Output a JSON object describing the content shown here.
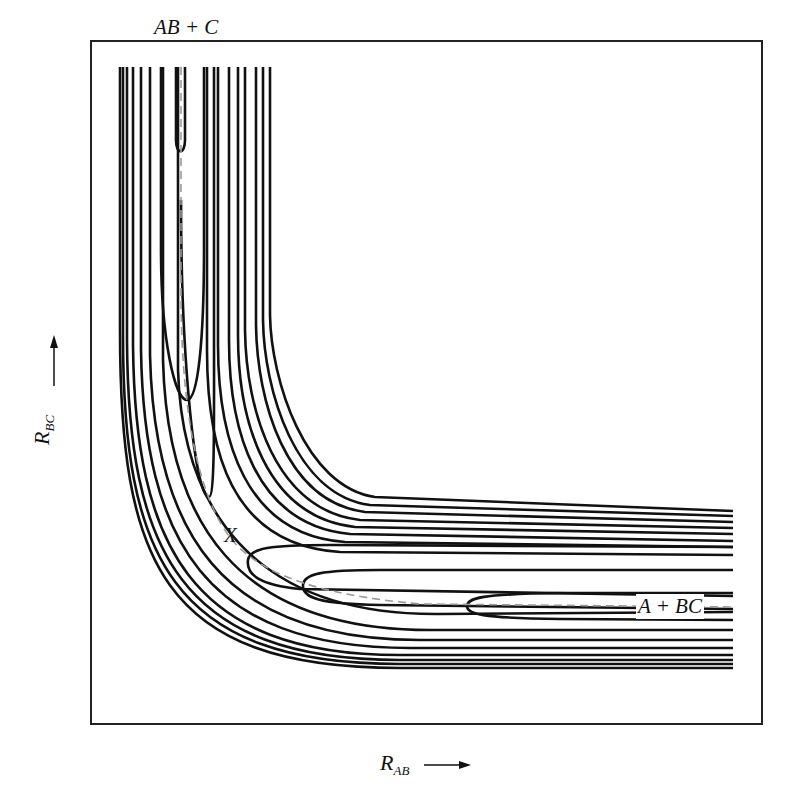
{
  "diagram": {
    "labels": {
      "reactant_valley": "AB + C",
      "product_valley": "A + BC",
      "saddle_point": "X"
    },
    "axes": {
      "x": {
        "symbol": "R",
        "subscript": "AB",
        "arrow": "⟶"
      },
      "y": {
        "symbol": "R",
        "subscript": "BC",
        "arrow": "⟶"
      }
    },
    "colors": {
      "contour": "#111111",
      "reaction_path": "#999999",
      "frame": "#222222",
      "background": "#ffffff"
    },
    "frame": {
      "x": 91,
      "y": 41,
      "width": 671,
      "height": 683
    },
    "contours": {
      "outer_walls": [
        {
          "vx": 120,
          "hy": 668
        },
        {
          "vx": 123,
          "hy": 664
        },
        {
          "vx": 127,
          "hy": 660
        },
        {
          "vx": 133,
          "hy": 655
        },
        {
          "vx": 141,
          "hy": 648
        },
        {
          "vx": 150,
          "hy": 640
        },
        {
          "vx": 163,
          "hy": 630
        },
        {
          "vx": 178,
          "hy": 616
        }
      ],
      "inner_walls": [
        {
          "vx": 207,
          "hy": 555
        },
        {
          "vx": 218,
          "hy": 547
        },
        {
          "vx": 229,
          "hy": 541
        },
        {
          "vx": 238,
          "hy": 534
        },
        {
          "vx": 245,
          "hy": 528
        },
        {
          "vx": 256,
          "hy": 522
        },
        {
          "vx": 263,
          "hy": 516
        },
        {
          "vx": 270,
          "hy": 511
        }
      ],
      "valley_loops": [
        {
          "name": "ab-valley-inner",
          "tip_y": 152
        },
        {
          "name": "ab-valley-outer",
          "tip_y": 400
        },
        {
          "name": "saddle-upper",
          "tip_y": 497
        },
        {
          "name": "saddle-lower",
          "tip_x": 248
        },
        {
          "name": "bc-valley-outer",
          "tip_x": 303
        },
        {
          "name": "bc-valley-inner",
          "tip_x": 467
        }
      ]
    }
  }
}
